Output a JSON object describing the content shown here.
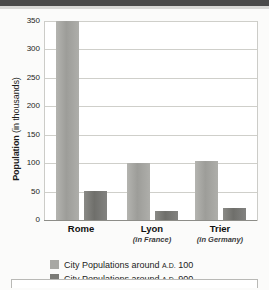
{
  "chart_data": {
    "type": "bar",
    "title": "",
    "xlabel": "",
    "ylabel": "Population (in thousands)",
    "ylabel_bold": "Population",
    "ylabel_rest": " (in thousands)",
    "ylim": [
      0,
      350
    ],
    "yticks": [
      350,
      300,
      250,
      200,
      150,
      100,
      50,
      0
    ],
    "ytick_labels": [
      "350",
      "300",
      "250",
      "200",
      "150",
      "100",
      "50",
      "0"
    ],
    "grid": true,
    "legend_position": "below-axis-left",
    "categories": [
      "Rome",
      "Lyon",
      "Trier"
    ],
    "category_sublabels": [
      "",
      "(in France)",
      "(in Germany)"
    ],
    "series": [
      {
        "name": "City Populations around A.D. 100",
        "name_prefix": "City Populations around ",
        "name_smallcaps": "A.D.",
        "name_suffix": " 100",
        "color": "#a8a8a4",
        "values": [
          350,
          100,
          103
        ]
      },
      {
        "name": "City Populations around A.D. 900",
        "name_prefix": "City Populations around ",
        "name_smallcaps": "A.D.",
        "name_suffix": " 900",
        "color": "#7b7b77",
        "values": [
          51,
          16,
          21
        ]
      }
    ]
  },
  "colors": {
    "series_100": "#a8a8a4",
    "series_900": "#7b7b77",
    "grid": "#cfcfca",
    "axis": "#8d8d88",
    "text": "#1b1b1b",
    "header_strip": "#4a4a4a"
  }
}
